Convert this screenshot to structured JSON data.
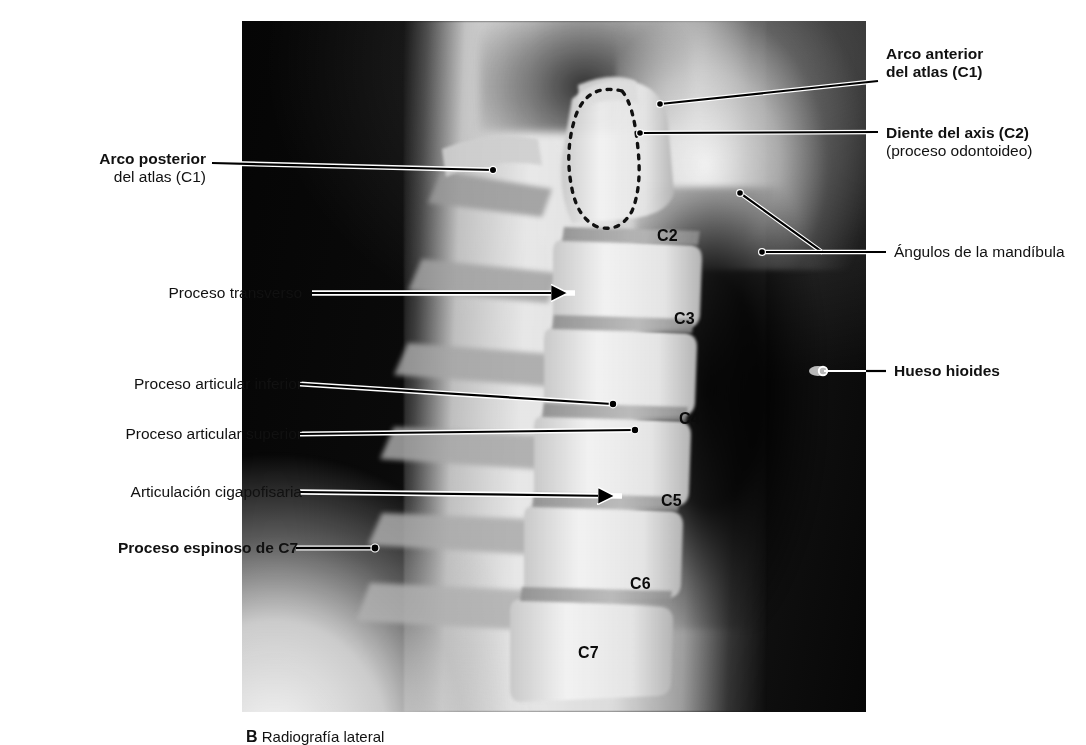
{
  "figure": {
    "type": "radiograph",
    "view": "Radiografía lateral de la columna cervical",
    "caption_letter": "B",
    "caption_text": "Radiografía lateral"
  },
  "labels_left": [
    {
      "id": "arco-posterior-atlas",
      "text": "Arco posterior",
      "subtext": "del atlas (C1)",
      "bold": true,
      "leader": "dot"
    },
    {
      "id": "proceso-transverso",
      "text": "Proceso transverso",
      "subtext": "",
      "bold": false,
      "leader": "arrow"
    },
    {
      "id": "proceso-articular-inferior",
      "text": "Proceso articular inferior",
      "subtext": "",
      "bold": false,
      "leader": "dot"
    },
    {
      "id": "proceso-articular-superior",
      "text": "Proceso articular superior",
      "subtext": "",
      "bold": false,
      "leader": "dot"
    },
    {
      "id": "articulacion-cigapofisaria",
      "text": "Articulación cigapofisaria",
      "subtext": "",
      "bold": false,
      "leader": "arrow"
    },
    {
      "id": "proceso-espinoso-c7",
      "text": "Proceso espinoso de C7",
      "subtext": "",
      "bold": true,
      "leader": "dot"
    }
  ],
  "labels_right": [
    {
      "id": "arco-anterior-atlas",
      "text": "Arco anterior",
      "subtext": "del atlas (C1)",
      "bold": true,
      "leader": "dot"
    },
    {
      "id": "diente-axis",
      "text": "Diente del axis (C2)",
      "subtext": "(proceso odontoideo)",
      "bold": true,
      "leader": "dot"
    },
    {
      "id": "angulos-mandibula",
      "text": "Ángulos de la mandíbula",
      "subtext": "",
      "bold": false,
      "leader": "double-dot"
    },
    {
      "id": "hueso-hioides",
      "text": "Hueso hioides",
      "subtext": "",
      "bold": true,
      "leader": "circle"
    }
  ],
  "vertebrae": [
    {
      "id": "c2",
      "label": "C2"
    },
    {
      "id": "c3",
      "label": "C3"
    },
    {
      "id": "c4",
      "label": "C4"
    },
    {
      "id": "c5",
      "label": "C5"
    },
    {
      "id": "c6",
      "label": "C6"
    },
    {
      "id": "c7",
      "label": "C7"
    }
  ],
  "annotations": {
    "dens_outline": "Contorno discontinuo del diente del axis"
  },
  "colors": {
    "background": "#ffffff",
    "text": "#111111",
    "leader_dark": "#000000",
    "leader_light": "#ffffff",
    "plate_dark": "#070707"
  }
}
